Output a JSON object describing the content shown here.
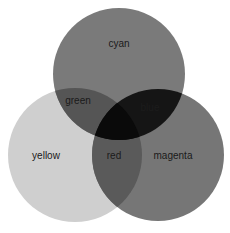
{
  "diagram": {
    "type": "venn",
    "sets": [
      {
        "name": "cyan",
        "label": "cyan",
        "color": "#7a7a7a"
      },
      {
        "name": "yellow",
        "label": "yellow",
        "color": "#cfcfcf"
      },
      {
        "name": "magenta",
        "label": "magenta",
        "color": "#767676"
      }
    ],
    "intersections": [
      {
        "sets": [
          "cyan",
          "yellow"
        ],
        "label": "green",
        "color": "#555555"
      },
      {
        "sets": [
          "cyan",
          "magenta"
        ],
        "label": "blue",
        "color": "#151515"
      },
      {
        "sets": [
          "yellow",
          "magenta"
        ],
        "label": "red",
        "color": "#5a5a5a"
      },
      {
        "sets": [
          "cyan",
          "yellow",
          "magenta"
        ],
        "label": "",
        "color": "#0a0a0a"
      }
    ]
  },
  "labels": {
    "cyan": "cyan",
    "green": "green",
    "blue": "blue",
    "yellow": "yellow",
    "red": "red",
    "magenta": "magenta"
  }
}
